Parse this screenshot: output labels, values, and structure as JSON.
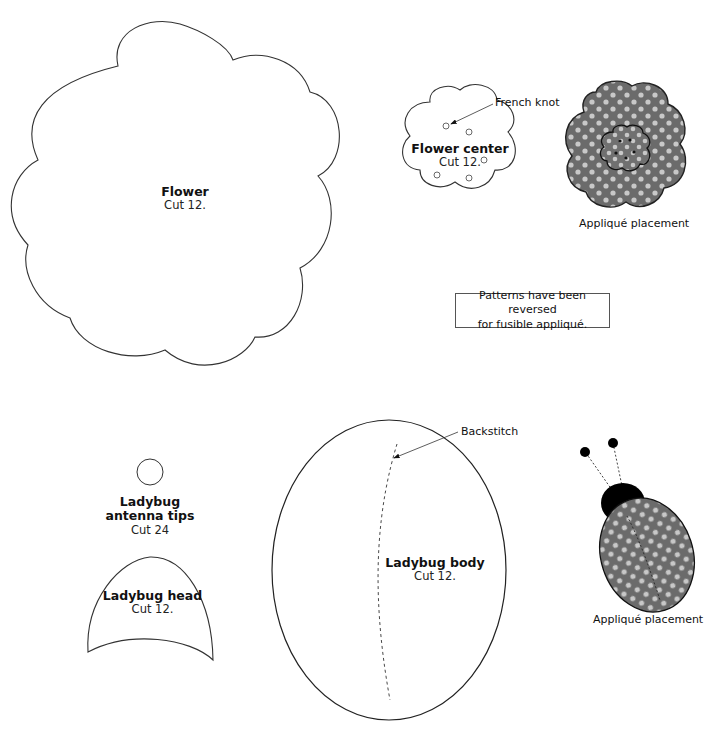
{
  "flower": {
    "title": "Flower",
    "cut": "Cut 12."
  },
  "flower_center": {
    "title": "Flower center",
    "cut": "Cut 12.",
    "callout": "French knot"
  },
  "flower_placement": {
    "caption": "Appliqué placement"
  },
  "note": {
    "line1": "Patterns have been reversed",
    "line2": "for fusible appliqué."
  },
  "antenna_tips": {
    "title_line1": "Ladybug",
    "title_line2": "antenna tips",
    "cut": "Cut 24"
  },
  "ladybug_head": {
    "title": "Ladybug head",
    "cut": "Cut 12."
  },
  "ladybug_body": {
    "title": "Ladybug body",
    "cut": "Cut 12.",
    "callout": "Backstitch"
  },
  "ladybug_placement": {
    "caption": "Appliqué placement"
  },
  "colors": {
    "fabric": "#6b6b6b",
    "dots": "#c8c8c8",
    "outline": "#222222",
    "black": "#000000"
  }
}
